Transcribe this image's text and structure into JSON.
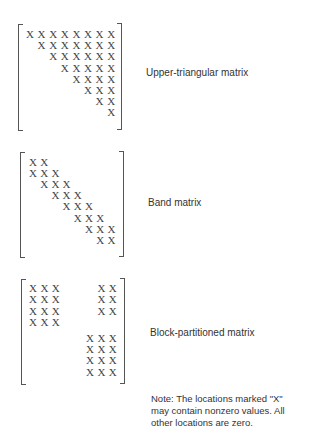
{
  "matrices": [
    {
      "label": "Upper-triangular matrix",
      "rows": [
        [
          0,
          1,
          2,
          3,
          4,
          5,
          6,
          7
        ],
        [
          1,
          2,
          3,
          4,
          5,
          6,
          7
        ],
        [
          2,
          3,
          4,
          5,
          6,
          7
        ],
        [
          3,
          4,
          5,
          6,
          7
        ],
        [
          4,
          5,
          6,
          7
        ],
        [
          5,
          6,
          7
        ],
        [
          6,
          7
        ],
        [
          7
        ]
      ]
    },
    {
      "label": "Band matrix",
      "rows": [
        [
          0,
          1
        ],
        [
          0,
          1,
          2
        ],
        [
          1,
          2,
          3
        ],
        [
          2,
          3,
          4
        ],
        [
          3,
          4,
          5
        ],
        [
          4,
          5,
          6
        ],
        [
          5,
          6,
          7
        ],
        [
          6,
          7
        ]
      ]
    },
    {
      "label": "Block-partitioned matrix",
      "rows": [
        [
          0,
          1,
          2,
          6,
          7
        ],
        [
          0,
          1,
          2,
          6,
          7
        ],
        [
          0,
          1,
          2,
          6,
          7
        ],
        [
          0,
          1,
          2
        ],
        [
          5,
          6,
          7
        ],
        [
          5,
          6,
          7
        ],
        [
          5,
          6,
          7
        ],
        [
          5,
          6,
          7
        ]
      ]
    }
  ],
  "cell_symbol": "X",
  "note": {
    "line1": "Note:  The locations marked \"X\"",
    "line2": "may contain nonzero values. All",
    "line3": "other locations are zero."
  }
}
